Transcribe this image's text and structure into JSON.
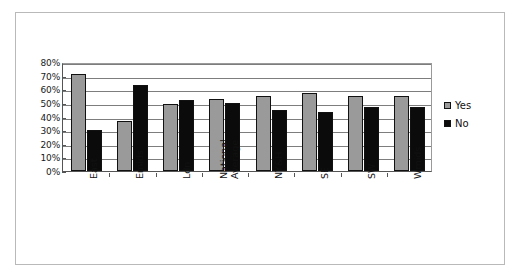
{
  "chart_data": {
    "type": "bar",
    "title": "",
    "xlabel": "",
    "ylabel": "",
    "ylim": [
      0,
      80
    ],
    "ytick_labels": [
      "80%",
      "70%",
      "60%",
      "50%",
      "40%",
      "30%",
      "20%",
      "10%",
      "0%"
    ],
    "ytick_values": [
      80,
      70,
      60,
      50,
      40,
      30,
      20,
      10,
      0
    ],
    "grid": true,
    "legend_position": "right",
    "categories": [
      "East",
      "Emids",
      "Ldn",
      "National Average",
      "NY&H",
      "SE",
      "SW",
      "Wmids"
    ],
    "series": [
      {
        "name": "Yes",
        "color": "#9a9a9a",
        "values": [
          71,
          37,
          49,
          53,
          55,
          57,
          55,
          55
        ]
      },
      {
        "name": "No",
        "color": "#0b0b0b",
        "values": [
          30,
          63,
          52,
          50,
          45,
          43,
          47,
          47
        ]
      }
    ]
  },
  "legend": {
    "items": [
      {
        "label": "Yes",
        "swatch": "yes-swatch-icon"
      },
      {
        "label": "No",
        "swatch": "no-swatch-icon"
      }
    ]
  }
}
